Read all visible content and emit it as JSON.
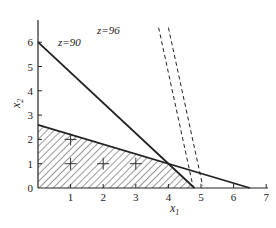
{
  "chart_data": {
    "type": "line",
    "title": "",
    "xlabel": "x1",
    "ylabel": "x2",
    "xlim": [
      0,
      7
    ],
    "ylim": [
      0,
      6.9
    ],
    "xticks": [
      1,
      2,
      3,
      4,
      5,
      6,
      7
    ],
    "yticks": [
      0,
      1,
      2,
      3,
      4,
      5,
      6
    ],
    "grid": false,
    "legend": null,
    "series": [
      {
        "name": "constraint-1",
        "style": "solid",
        "points": [
          [
            0,
            6
          ],
          [
            4.8,
            0
          ]
        ]
      },
      {
        "name": "constraint-2",
        "style": "solid",
        "points": [
          [
            0,
            2.6
          ],
          [
            6.5,
            0
          ]
        ]
      },
      {
        "name": "z=90",
        "style": "dashed",
        "points": [
          [
            3.7,
            6.6
          ],
          [
            4.75,
            0.1
          ]
        ]
      },
      {
        "name": "z=96",
        "style": "dashed",
        "points": [
          [
            4.0,
            6.6
          ],
          [
            5.05,
            0.1
          ]
        ]
      }
    ],
    "feasible_region": {
      "fill": "hatched",
      "vertices": [
        [
          0,
          0
        ],
        [
          0,
          2.6
        ],
        [
          3.9,
          1.04
        ],
        [
          4.8,
          0
        ]
      ]
    },
    "integer_points": [
      [
        1,
        1
      ],
      [
        2,
        1
      ],
      [
        3,
        1
      ],
      [
        1,
        2
      ]
    ],
    "annotations": [
      {
        "text": "z=90",
        "x": 2.0,
        "y": 6.35
      },
      {
        "text": "z=96",
        "x": 4.6,
        "y": 6.55
      }
    ]
  },
  "labels": {
    "xlabel_main": "x",
    "xlabel_sub": "1",
    "ylabel_main": "x",
    "ylabel_sub": "2",
    "z90": "z=90",
    "z96": "z=96",
    "xtick": [
      "1",
      "2",
      "3",
      "4",
      "5",
      "6",
      "7"
    ],
    "ytick": [
      "0",
      "1",
      "2",
      "3",
      "4",
      "5",
      "6"
    ]
  }
}
